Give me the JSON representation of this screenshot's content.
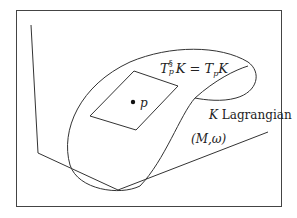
{
  "figure": {
    "labels": {
      "tangent_lhs_T": "T",
      "tangent_lhs_sup": "§",
      "tangent_lhs_sub": "p",
      "tangent_lhs_K": "K",
      "equals": " = ",
      "tangent_rhs_T": "T",
      "tangent_rhs_sub": "p",
      "tangent_rhs_K": "K",
      "point_label": "p",
      "submanifold_K": "K",
      "submanifold_desc": "Lagrangian",
      "manifold": "(M,ω)"
    },
    "colors": {
      "stroke": "#333333",
      "frame": "#444444",
      "background": "#ffffff"
    }
  }
}
